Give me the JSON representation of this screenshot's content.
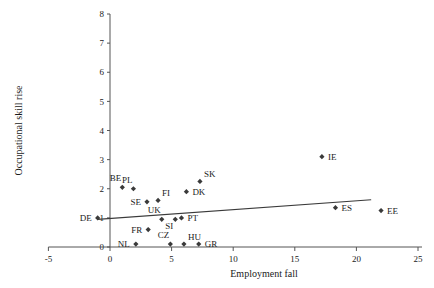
{
  "chart_data": {
    "type": "scatter",
    "title": "",
    "xlabel": "Employment fall",
    "ylabel": "Occupational skill rise",
    "xlim": [
      -5,
      25
    ],
    "ylim": [
      0,
      8
    ],
    "xticks": [
      -5,
      0,
      5,
      10,
      15,
      20,
      25
    ],
    "yticks": [
      0,
      1,
      2,
      3,
      4,
      5,
      6,
      7,
      8
    ],
    "xtick_labels": [
      "-5",
      "0",
      "5",
      "10",
      "15",
      "20",
      "25"
    ],
    "ytick_labels": [
      "0",
      "1",
      "2",
      "3",
      "4",
      "5",
      "6",
      "7",
      "8"
    ],
    "grid": false,
    "legend": "none",
    "points": [
      {
        "label": "DE",
        "x": -1.0,
        "y": 1.0,
        "label_pos": "left"
      },
      {
        "label": "BE",
        "x": 1.0,
        "y": 2.05,
        "label_pos": "upper-left"
      },
      {
        "label": "PL",
        "x": 1.9,
        "y": 2.0,
        "label_pos": "upper-left"
      },
      {
        "label": "NL",
        "x": 2.1,
        "y": 0.1,
        "label_pos": "left"
      },
      {
        "label": "SE",
        "x": 3.0,
        "y": 1.55,
        "label_pos": "left"
      },
      {
        "label": "FR",
        "x": 3.1,
        "y": 0.6,
        "label_pos": "left"
      },
      {
        "label": "FI",
        "x": 3.9,
        "y": 1.6,
        "label_pos": "upper-right"
      },
      {
        "label": "UK",
        "x": 4.2,
        "y": 0.95,
        "label_pos": "upper-left"
      },
      {
        "label": "CZ",
        "x": 4.9,
        "y": 0.1,
        "label_pos": "upper-left"
      },
      {
        "label": "SI",
        "x": 5.3,
        "y": 0.95,
        "label_pos": "lower-left"
      },
      {
        "label": "HU",
        "x": 6.0,
        "y": 0.1,
        "label_pos": "upper-right"
      },
      {
        "label": "PT",
        "x": 5.8,
        "y": 1.0,
        "label_pos": "right"
      },
      {
        "label": "GR",
        "x": 7.2,
        "y": 0.1,
        "label_pos": "right"
      },
      {
        "label": "DK",
        "x": 6.2,
        "y": 1.9,
        "label_pos": "right"
      },
      {
        "label": "SK",
        "x": 7.3,
        "y": 2.25,
        "label_pos": "upper-right"
      },
      {
        "label": "IE",
        "x": 17.2,
        "y": 3.1,
        "label_pos": "right"
      },
      {
        "label": "ES",
        "x": 18.3,
        "y": 1.35,
        "label_pos": "right"
      },
      {
        "label": "EE",
        "x": 22.0,
        "y": 1.25,
        "label_pos": "right"
      }
    ],
    "trendline": {
      "x0": -1.0,
      "y0": 0.95,
      "x1": 21.2,
      "y1": 1.62
    }
  }
}
